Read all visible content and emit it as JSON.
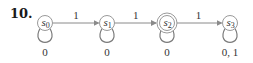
{
  "problem_number": "10.",
  "states": [
    {
      "id": "s0",
      "name": "s",
      "sub": "0",
      "final": false,
      "loop_label": "0"
    },
    {
      "id": "s1",
      "name": "s",
      "sub": "1",
      "final": false,
      "loop_label": "0"
    },
    {
      "id": "s2",
      "name": "s",
      "sub": "2",
      "final": true,
      "loop_label": "0"
    },
    {
      "id": "s3",
      "name": "s",
      "sub": "3",
      "final": false,
      "loop_label": "0, 1"
    }
  ],
  "transitions": [
    {
      "from": "s0",
      "to": "s1",
      "label": "1"
    },
    {
      "from": "s1",
      "to": "s2",
      "label": "1"
    },
    {
      "from": "s2",
      "to": "s3",
      "label": "1"
    }
  ]
}
